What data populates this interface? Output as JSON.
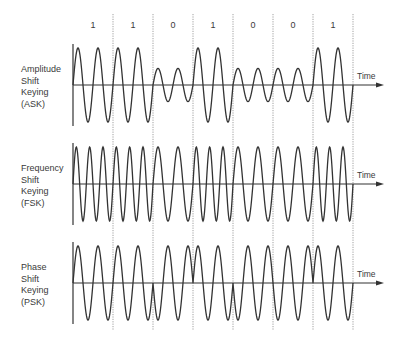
{
  "diagram": {
    "bits": [
      "1",
      "1",
      "0",
      "1",
      "0",
      "0",
      "1"
    ],
    "axis_label": "Time",
    "rows": [
      {
        "id": "ask",
        "label_lines": [
          "Amplitude",
          "Shift",
          "Keying",
          "(ASK)"
        ],
        "scheme": "amplitude"
      },
      {
        "id": "fsk",
        "label_lines": [
          "Frequency",
          "Shift",
          "Keying",
          "(FSK)"
        ],
        "scheme": "frequency"
      },
      {
        "id": "psk",
        "label_lines": [
          "Phase",
          "Shift",
          "Keying",
          "(PSK)"
        ],
        "scheme": "phase"
      }
    ],
    "colors": {
      "line": "#333333",
      "divider": "#888888",
      "text": "#3a3a3a"
    }
  }
}
